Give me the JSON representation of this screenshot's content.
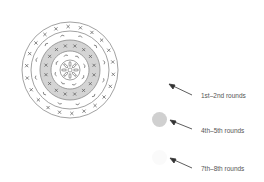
{
  "diagram": {
    "colors": {
      "line": "#8a8a8a",
      "band_fill": "#d4d4d4",
      "stitch": "#555555",
      "swatch_4_5": "#d0d0d0",
      "swatch_7_8": "#fafafa"
    },
    "legend": [
      {
        "id": "rounds-1-2",
        "label": "1st–2nd rounds",
        "swatch": "none"
      },
      {
        "id": "rounds-4-5",
        "label": "4th–5th rounds",
        "swatch": "gray"
      },
      {
        "id": "rounds-7-8",
        "label": "7th–8th rounds",
        "swatch": "white"
      }
    ]
  }
}
